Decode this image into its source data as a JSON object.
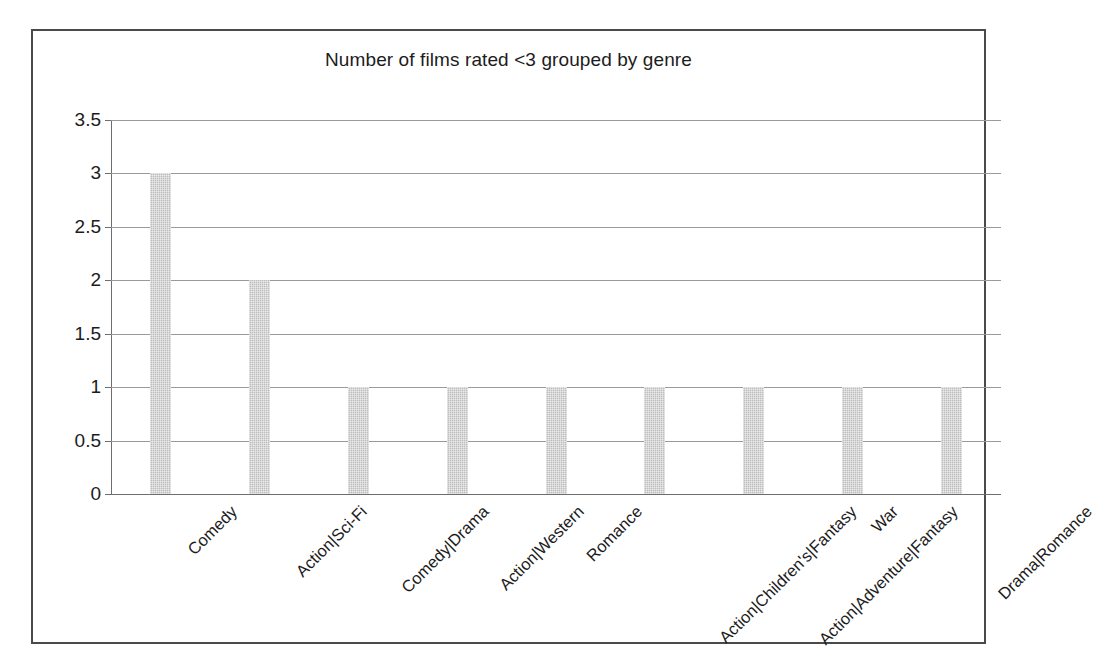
{
  "chart_data": {
    "type": "bar",
    "title": "Number of films rated <3 grouped by genre",
    "xlabel": "",
    "ylabel": "",
    "ylim": [
      0,
      3.5
    ],
    "grid": true,
    "legend": false,
    "orientation": "vertical",
    "bar_color": "#bdbdbd",
    "categories": [
      "Comedy",
      "Action|Sci-Fi",
      "Comedy|Drama",
      "Action|Western",
      "Romance",
      "Action|Children's|Fantasy",
      "Action|Adventure|Fantasy",
      "War",
      "Drama|Romance"
    ],
    "values": [
      3,
      2,
      1,
      1,
      1,
      1,
      1,
      1,
      1
    ],
    "ytick_labels": [
      "0",
      "0.5",
      "1",
      "1.5",
      "2",
      "2.5",
      "3",
      "3.5"
    ],
    "ytick_values": [
      0,
      0.5,
      1,
      1.5,
      2,
      2.5,
      3,
      3.5
    ]
  },
  "frame": {
    "border_color": "#4a4a4a",
    "grid_color": "#9a9a9a",
    "axis_color": "#6d6d6d",
    "text_color": "#1c1c1c"
  }
}
